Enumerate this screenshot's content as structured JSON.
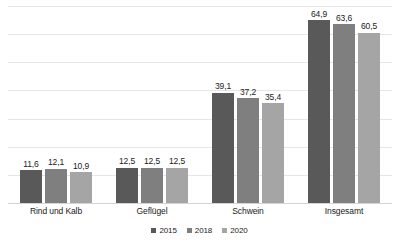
{
  "chart_data": {
    "type": "bar",
    "title": "",
    "subtitle": "",
    "xlabel": "",
    "ylabel": "",
    "categories": [
      "Rind und Kalb",
      "Geflügel",
      "Schwein",
      "Insgesamt"
    ],
    "series": [
      {
        "name": "2015",
        "color": "#595959",
        "values": [
          11.6,
          12.5,
          39.1,
          64.9
        ],
        "labels": [
          "11,6",
          "12,5",
          "39,1",
          "64,9"
        ]
      },
      {
        "name": "2018",
        "color": "#7f7f7f",
        "values": [
          12.1,
          12.5,
          37.2,
          63.6
        ],
        "labels": [
          "12,1",
          "12,5",
          "37,2",
          "63,6"
        ]
      },
      {
        "name": "2020",
        "color": "#a5a5a5",
        "values": [
          10.9,
          12.5,
          35.4,
          60.5
        ],
        "labels": [
          "10,9",
          "12,5",
          "35,4",
          "60,5"
        ]
      }
    ],
    "ylim": [
      0,
      70
    ],
    "ytick_step": 10,
    "yticks_visible": false,
    "grid": true,
    "grid_color": "#e6e6e6",
    "legend_position": "bottom",
    "decimal_separator": ","
  },
  "legend": {
    "items": [
      {
        "label": "2015",
        "color": "#595959"
      },
      {
        "label": "2018",
        "color": "#7f7f7f"
      },
      {
        "label": "2020",
        "color": "#a5a5a5"
      }
    ]
  },
  "axis": {
    "categories": [
      "Rind und Kalb",
      "Geflügel",
      "Schwein",
      "Insgesamt"
    ]
  }
}
